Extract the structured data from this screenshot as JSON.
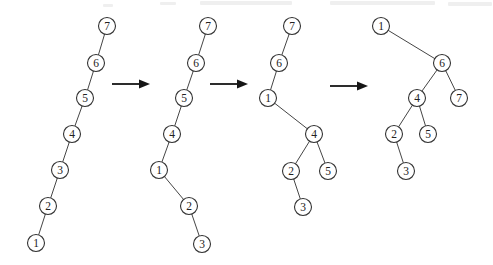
{
  "figure": {
    "width": 493,
    "height": 265,
    "background": "#ffffff",
    "node_fill": "#ffffff",
    "node_stroke_color": "#333333",
    "node_label_color": "#222222",
    "edge_color": "#454545",
    "arrow_color": "#161616",
    "node_radius": 8.5
  },
  "trees": [
    {
      "name": "tree-1",
      "description": "left-leaning chain 7-6-5-4-3-2-1",
      "nodes": [
        {
          "label": "7",
          "x": 107,
          "y": 26
        },
        {
          "label": "6",
          "x": 96,
          "y": 63
        },
        {
          "label": "5",
          "x": 85,
          "y": 98
        },
        {
          "label": "4",
          "x": 72,
          "y": 134
        },
        {
          "label": "3",
          "x": 60,
          "y": 170
        },
        {
          "label": "2",
          "x": 48,
          "y": 206
        },
        {
          "label": "1",
          "x": 36,
          "y": 243
        }
      ],
      "edges": [
        [
          "7",
          "6"
        ],
        [
          "6",
          "5"
        ],
        [
          "5",
          "4"
        ],
        [
          "4",
          "3"
        ],
        [
          "3",
          "2"
        ],
        [
          "2",
          "1"
        ]
      ]
    },
    {
      "name": "tree-2",
      "description": "chain 7-6-5-4 with left child 1, 1 has right child 2, 2 has right child 3",
      "nodes": [
        {
          "label": "7",
          "x": 208,
          "y": 26
        },
        {
          "label": "6",
          "x": 196,
          "y": 63
        },
        {
          "label": "5",
          "x": 184,
          "y": 98
        },
        {
          "label": "4",
          "x": 172,
          "y": 134
        },
        {
          "label": "1",
          "x": 159,
          "y": 170
        },
        {
          "label": "2",
          "x": 189,
          "y": 206
        },
        {
          "label": "3",
          "x": 202,
          "y": 244
        }
      ],
      "edges": [
        [
          "7",
          "6"
        ],
        [
          "6",
          "5"
        ],
        [
          "5",
          "4"
        ],
        [
          "4",
          "1"
        ],
        [
          "1",
          "2"
        ],
        [
          "2",
          "3"
        ]
      ]
    },
    {
      "name": "tree-3",
      "description": "7-6-1 chain, 1 has right child 4, 4 has children 2 and 5, 2 has right child 3",
      "nodes": [
        {
          "label": "7",
          "x": 292,
          "y": 26
        },
        {
          "label": "6",
          "x": 279,
          "y": 63
        },
        {
          "label": "1",
          "x": 268,
          "y": 98
        },
        {
          "label": "4",
          "x": 314,
          "y": 134
        },
        {
          "label": "2",
          "x": 291,
          "y": 171
        },
        {
          "label": "5",
          "x": 328,
          "y": 171
        },
        {
          "label": "3",
          "x": 303,
          "y": 207
        }
      ],
      "edges": [
        [
          "7",
          "6"
        ],
        [
          "6",
          "1"
        ],
        [
          "1",
          "4"
        ],
        [
          "4",
          "2"
        ],
        [
          "4",
          "5"
        ],
        [
          "2",
          "3"
        ]
      ]
    },
    {
      "name": "tree-4",
      "description": "root 1 with right child 6, 6 has children 4 and 7, 4 has children 2 and 5, 2 has right child 3",
      "nodes": [
        {
          "label": "1",
          "x": 381,
          "y": 26
        },
        {
          "label": "6",
          "x": 442,
          "y": 63
        },
        {
          "label": "4",
          "x": 417,
          "y": 98
        },
        {
          "label": "7",
          "x": 459,
          "y": 98
        },
        {
          "label": "2",
          "x": 394,
          "y": 134
        },
        {
          "label": "5",
          "x": 428,
          "y": 134
        },
        {
          "label": "3",
          "x": 406,
          "y": 171
        }
      ],
      "edges": [
        [
          "1",
          "6"
        ],
        [
          "6",
          "4"
        ],
        [
          "6",
          "7"
        ],
        [
          "4",
          "2"
        ],
        [
          "4",
          "5"
        ],
        [
          "2",
          "3"
        ]
      ]
    }
  ],
  "arrows": [
    {
      "name": "arrow-1",
      "x1": 112,
      "x2": 150,
      "y": 84
    },
    {
      "name": "arrow-2",
      "x1": 210,
      "x2": 248,
      "y": 84
    },
    {
      "name": "arrow-3",
      "x1": 330,
      "x2": 368,
      "y": 86
    }
  ],
  "scan_artifacts": [
    {
      "x": 200,
      "y": 1,
      "w": 92,
      "h": 4
    },
    {
      "x": 330,
      "y": 1,
      "w": 105,
      "h": 4
    },
    {
      "x": 448,
      "y": 2,
      "w": 44,
      "h": 4
    },
    {
      "x": 160,
      "y": 2,
      "w": 16,
      "h": 3
    },
    {
      "x": 103,
      "y": 4,
      "w": 10,
      "h": 3
    }
  ]
}
